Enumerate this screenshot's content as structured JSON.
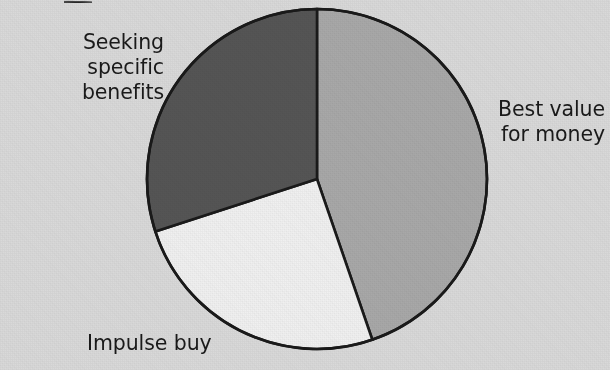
{
  "figure": {
    "background_color": "#d9d9d9",
    "text_color": "#1a1a1a",
    "outline_color": "#1a1a1a",
    "top_crop_artifact": " "
  },
  "chart_data": {
    "type": "pie",
    "title": "",
    "subtitle": "",
    "xlabel": "",
    "ylabel": "",
    "grid": false,
    "legend_position": "outside-labels",
    "labels_outside": true,
    "start_angle_deg": 0,
    "direction": "clockwise",
    "center_px": [
      317,
      179
    ],
    "radius_px": 170,
    "categories": [
      "Best value for money",
      "Impulse buy",
      "Seeking specific benefits"
    ],
    "values": [
      45,
      25,
      30
    ],
    "value_unit": "percent",
    "slices": [
      {
        "label": "Best value for money",
        "label_line1": "Best value",
        "label_line2": "for money",
        "value": 45,
        "start_angle_deg": 0,
        "end_angle_deg": 161,
        "color": "#a8a8a8"
      },
      {
        "label": "Impulse buy",
        "label_line1": "Impulse buy",
        "label_line2": "",
        "value": 25,
        "start_angle_deg": 161,
        "end_angle_deg": 252,
        "color": "#f0f0f0"
      },
      {
        "label": "Seeking specific benefits",
        "label_line1": "Seeking specific",
        "label_line2": "benefits",
        "value": 30,
        "start_angle_deg": 252,
        "end_angle_deg": 360,
        "color": "#555555"
      }
    ]
  },
  "labels": {
    "seeking": "Seeking specific\nbenefits",
    "best_value": "Best value\nfor money",
    "impulse": "Impulse buy"
  }
}
